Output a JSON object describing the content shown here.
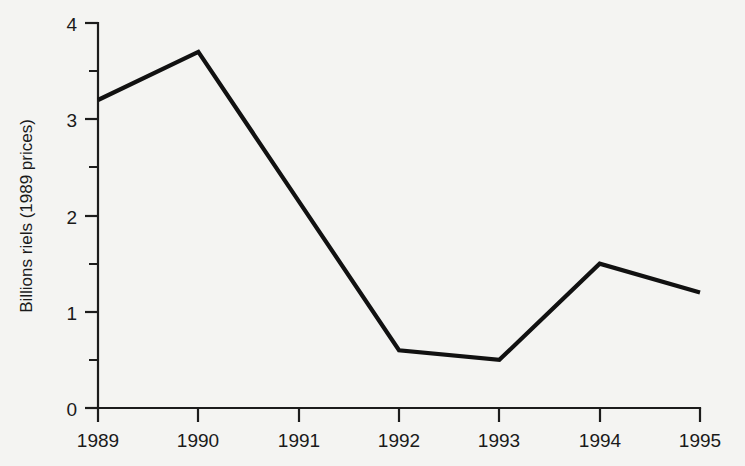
{
  "chart_data": {
    "type": "line",
    "title": "",
    "subtitle": "",
    "xlabel": "",
    "ylabel": "Billions riels (1989 prices)",
    "categories": [
      "1989",
      "1990",
      "1991",
      "1992",
      "1993",
      "1994",
      "1995"
    ],
    "x": [
      1989,
      1990,
      1991,
      1992,
      1993,
      1994,
      1995
    ],
    "values": [
      3.2,
      3.7,
      2.15,
      0.6,
      0.5,
      1.5,
      1.2
    ],
    "series": [
      {
        "name": "",
        "values": [
          3.2,
          3.7,
          2.15,
          0.6,
          0.5,
          1.5,
          1.2
        ]
      }
    ],
    "vertices": [
      {
        "x": "1989",
        "y": 3.2
      },
      {
        "x": "1990",
        "y": 3.7
      },
      {
        "x": "1992",
        "y": 0.6
      },
      {
        "x": "1993",
        "y": 0.5
      },
      {
        "x": "1994",
        "y": 1.5
      },
      {
        "x": "1995",
        "y": 1.2
      }
    ],
    "xlim": [
      1989,
      1995
    ],
    "ylim": [
      0,
      4
    ],
    "ytick_labels": [
      "0",
      "1",
      "2",
      "3",
      "4"
    ],
    "ytick_values": [
      0,
      1,
      2,
      3,
      4
    ],
    "yminor_values": [
      0.5,
      1.5,
      2.5,
      3.5
    ],
    "xtick_labels": [
      "1989",
      "1990",
      "1991",
      "1992",
      "1993",
      "1994",
      "1995"
    ],
    "grid": false,
    "legend": false,
    "legend_position": "none",
    "colors": {
      "background": "#f4f4f2",
      "line": "#111111",
      "axis": "#1c1c1c",
      "text": "#1a1a1a"
    }
  },
  "axis": {
    "y_title": "Billions riels (1989 prices)",
    "y_ticks": [
      {
        "label": "4",
        "value": 4
      },
      {
        "label": "3",
        "value": 3
      },
      {
        "label": "2",
        "value": 2
      },
      {
        "label": "1",
        "value": 1
      },
      {
        "label": "0",
        "value": 0
      }
    ],
    "x_ticks": [
      {
        "label": "1989",
        "value": 1989
      },
      {
        "label": "1990",
        "value": 1990
      },
      {
        "label": "1991",
        "value": 1991
      },
      {
        "label": "1992",
        "value": 1992
      },
      {
        "label": "1993",
        "value": 1993
      },
      {
        "label": "1994",
        "value": 1994
      },
      {
        "label": "1995",
        "value": 1995
      }
    ]
  }
}
